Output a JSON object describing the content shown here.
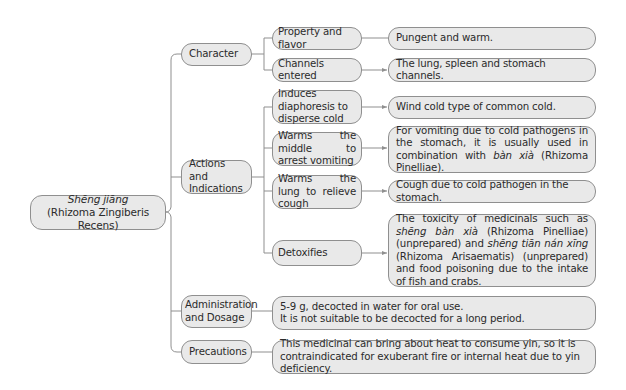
{
  "root": {
    "title_italic": "Shēng jiāng",
    "subtitle": "(Rhizoma Zingiberis Recens)"
  },
  "level1": [
    {
      "label": "Character"
    },
    {
      "label": "Actions and Indications"
    },
    {
      "label": "Administration and Dosage"
    },
    {
      "label": "Precautions"
    }
  ],
  "character": {
    "items": [
      {
        "label": "Property and flavor",
        "detail": "Pungent and warm."
      },
      {
        "label": "Channels entered",
        "detail": "The lung, spleen and stomach channels."
      }
    ]
  },
  "actions": {
    "items": [
      {
        "label": "Induces diaphoresis to disperse cold",
        "detail": "Wind cold type of common cold."
      },
      {
        "label": "Warms the middle to arrest vomiting",
        "detail_pre": "For vomiting due to cold pathogens in the stomach, it is usually used in combination with ",
        "detail_italic": "bàn xià",
        "detail_post": " (Rhizoma Pinelliae)."
      },
      {
        "label": "Warms the lung to relieve cough",
        "detail": "Cough due to cold pathogen in the stomach."
      },
      {
        "label": "Detoxifies",
        "detail_pre": "The toxicity of medicinals such as ",
        "detail_italic1": "shēng bàn xià",
        "detail_mid": " (Rhizoma Pinelliae) (unprepared) and ",
        "detail_italic2": "shēng tiān nán xīng",
        "detail_post": " (Rhizoma Arisaematis) (unprepared) and food poisoning due to the intake of fish and crabs."
      }
    ]
  },
  "administration": {
    "line1": "5-9 g, decocted in water for oral use.",
    "line2": "It is not suitable to be decocted for a long period."
  },
  "precautions": {
    "detail": "This medicinal can bring about heat to consume yin, so it is contraindicated for exuberant fire or internal heat due to yin deficiency."
  },
  "colors": {
    "box_fill": "#e9e9e9",
    "box_border": "#8f8f8f",
    "connector": "#8f8f8f",
    "text": "#2b2b2b"
  }
}
